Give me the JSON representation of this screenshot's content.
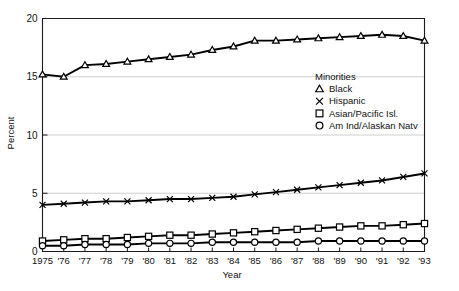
{
  "chart_data": {
    "type": "line",
    "title": "",
    "xlabel": "Year",
    "ylabel": "Percent",
    "ylim": [
      0,
      20
    ],
    "yticks": [
      0,
      5,
      10,
      15,
      20
    ],
    "grid": true,
    "grid_axis": "y",
    "legend_position": "upper-right-inside",
    "legend_title": "Minorities",
    "x": [
      1975,
      1976,
      1977,
      1978,
      1979,
      1980,
      1981,
      1982,
      1983,
      1984,
      1985,
      1986,
      1987,
      1988,
      1989,
      1990,
      1991,
      1992,
      1993
    ],
    "xtick_labels": [
      "1975",
      "'76",
      "'77",
      "'78",
      "'79",
      "'80",
      "'81",
      "'82",
      "'83",
      "'84",
      "'85",
      "'86",
      "'87",
      "'88",
      "'89",
      "'90",
      "'91",
      "'92",
      "'93"
    ],
    "series": [
      {
        "name": "Black",
        "marker": "triangle",
        "values": [
          15.2,
          15.0,
          16.0,
          16.1,
          16.3,
          16.5,
          16.7,
          16.9,
          17.3,
          17.6,
          18.1,
          18.1,
          18.2,
          18.3,
          18.4,
          18.5,
          18.6,
          18.5,
          18.1
        ]
      },
      {
        "name": "Hispanic",
        "marker": "x",
        "values": [
          4.0,
          4.1,
          4.2,
          4.3,
          4.3,
          4.4,
          4.5,
          4.5,
          4.6,
          4.7,
          4.9,
          5.1,
          5.3,
          5.5,
          5.7,
          5.9,
          6.1,
          6.4,
          6.7
        ]
      },
      {
        "name": "Asian/Pacific Isl.",
        "marker": "square",
        "values": [
          0.9,
          1.0,
          1.1,
          1.1,
          1.2,
          1.3,
          1.4,
          1.4,
          1.5,
          1.6,
          1.7,
          1.8,
          1.9,
          2.0,
          2.1,
          2.2,
          2.2,
          2.3,
          2.4
        ]
      },
      {
        "name": "Am Ind/Alaskan Natv",
        "marker": "circle",
        "values": [
          0.5,
          0.5,
          0.6,
          0.6,
          0.6,
          0.7,
          0.7,
          0.7,
          0.8,
          0.8,
          0.8,
          0.8,
          0.8,
          0.9,
          0.9,
          0.9,
          0.9,
          0.9,
          0.9
        ]
      }
    ]
  },
  "axes": {
    "ylabel": "Percent",
    "xlabel": "Year",
    "ytick_labels": [
      "0",
      "5",
      "10",
      "15",
      "20"
    ]
  },
  "legend": {
    "title": "Minorities",
    "entries": [
      {
        "label": "Black",
        "marker": "triangle"
      },
      {
        "label": "Hispanic",
        "marker": "x"
      },
      {
        "label": "Asian/Pacific Isl.",
        "marker": "square"
      },
      {
        "label": "Am Ind/Alaskan Natv",
        "marker": "circle"
      }
    ]
  },
  "caption": {
    "text": ""
  }
}
